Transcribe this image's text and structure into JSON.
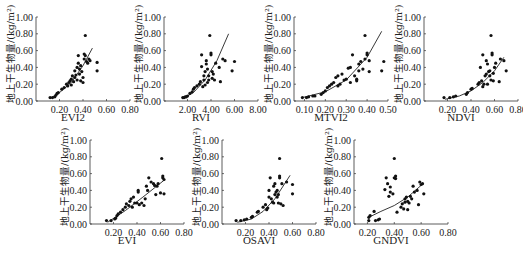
{
  "chart_data": [
    {
      "type": "scatter",
      "title": "EVI2",
      "xlabel": "EVI2",
      "ylabel": "地上干生物量/(kg/m²)",
      "xlim": [
        0,
        0.8
      ],
      "ylim": [
        0,
        1.0
      ],
      "xticks": [
        "0.20",
        "0.40",
        "0.60",
        "0.80"
      ],
      "yticks": [
        "0.00",
        "0.20",
        "0.40",
        "0.60",
        "0.80",
        "1.00"
      ],
      "fit": {
        "x": [
          0.12,
          0.2,
          0.3,
          0.4,
          0.48
        ],
        "y": [
          0.03,
          0.1,
          0.22,
          0.42,
          0.63
        ]
      },
      "points": [
        [
          0.12,
          0.04
        ],
        [
          0.14,
          0.04
        ],
        [
          0.16,
          0.05
        ],
        [
          0.17,
          0.07
        ],
        [
          0.18,
          0.09
        ],
        [
          0.19,
          0.1
        ],
        [
          0.22,
          0.14
        ],
        [
          0.24,
          0.16
        ],
        [
          0.26,
          0.2
        ],
        [
          0.27,
          0.18
        ],
        [
          0.28,
          0.22
        ],
        [
          0.29,
          0.24
        ],
        [
          0.3,
          0.19
        ],
        [
          0.3,
          0.26
        ],
        [
          0.31,
          0.3
        ],
        [
          0.32,
          0.23
        ],
        [
          0.33,
          0.28
        ],
        [
          0.33,
          0.36
        ],
        [
          0.34,
          0.31
        ],
        [
          0.35,
          0.4
        ],
        [
          0.35,
          0.25
        ],
        [
          0.36,
          0.45
        ],
        [
          0.36,
          0.54
        ],
        [
          0.37,
          0.38
        ],
        [
          0.37,
          0.32
        ],
        [
          0.38,
          0.24
        ],
        [
          0.38,
          0.42
        ],
        [
          0.39,
          0.35
        ],
        [
          0.4,
          0.22
        ],
        [
          0.4,
          0.28
        ],
        [
          0.41,
          0.5
        ],
        [
          0.41,
          0.56
        ],
        [
          0.42,
          0.54
        ],
        [
          0.42,
          0.78
        ],
        [
          0.43,
          0.47
        ],
        [
          0.44,
          0.45
        ],
        [
          0.45,
          0.5
        ],
        [
          0.46,
          0.48
        ],
        [
          0.52,
          0.46
        ],
        [
          0.52,
          0.36
        ]
      ]
    },
    {
      "type": "scatter",
      "title": "RVI",
      "xlabel": "RVI",
      "ylabel": "地上干生物量/(kg/m²)",
      "xlim": [
        0,
        8.0
      ],
      "ylim": [
        0,
        1.0
      ],
      "xticks": [
        "2.00",
        "4.00",
        "6.00",
        "8.00"
      ],
      "yticks": [
        "0.00",
        "0.20",
        "0.40",
        "0.60",
        "0.80",
        "1.00"
      ],
      "fit": {
        "x": [
          1.6,
          2.5,
          3.5,
          4.5,
          5.5
        ],
        "y": [
          0.03,
          0.1,
          0.25,
          0.48,
          0.8
        ]
      },
      "points": [
        [
          1.6,
          0.04
        ],
        [
          1.7,
          0.04
        ],
        [
          1.8,
          0.05
        ],
        [
          1.9,
          0.05
        ],
        [
          2.0,
          0.06
        ],
        [
          2.2,
          0.09
        ],
        [
          2.4,
          0.11
        ],
        [
          2.5,
          0.14
        ],
        [
          2.6,
          0.16
        ],
        [
          2.8,
          0.18
        ],
        [
          3.0,
          0.2
        ],
        [
          3.1,
          0.23
        ],
        [
          3.2,
          0.41
        ],
        [
          3.2,
          0.55
        ],
        [
          3.3,
          0.17
        ],
        [
          3.4,
          0.25
        ],
        [
          3.4,
          0.3
        ],
        [
          3.5,
          0.35
        ],
        [
          3.5,
          0.19
        ],
        [
          3.6,
          0.48
        ],
        [
          3.6,
          0.44
        ],
        [
          3.7,
          0.22
        ],
        [
          3.7,
          0.38
        ],
        [
          3.8,
          0.3
        ],
        [
          3.8,
          0.25
        ],
        [
          3.9,
          0.78
        ],
        [
          4.0,
          0.55
        ],
        [
          4.0,
          0.57
        ],
        [
          4.1,
          0.35
        ],
        [
          4.1,
          0.27
        ],
        [
          4.2,
          0.32
        ],
        [
          4.3,
          0.25
        ],
        [
          4.4,
          0.45
        ],
        [
          4.7,
          0.4
        ],
        [
          4.8,
          0.23
        ],
        [
          5.0,
          0.5
        ],
        [
          5.2,
          0.48
        ],
        [
          5.8,
          0.36
        ],
        [
          6.0,
          0.47
        ]
      ]
    },
    {
      "type": "scatter",
      "title": "MTVI2",
      "xlabel": "MTVI2",
      "ylabel": "地上干生物量/(kg/m²)",
      "xlim": [
        0.05,
        0.5
      ],
      "ylim": [
        0,
        1.0
      ],
      "xticks": [
        "0.10",
        "0.20",
        "0.30",
        "0.40",
        "0.50"
      ],
      "yticks": [
        "0.00",
        "0.20",
        "0.40",
        "0.60",
        "0.80",
        "1.00"
      ],
      "fit": {
        "x": [
          0.09,
          0.2,
          0.3,
          0.4,
          0.47
        ],
        "y": [
          0.04,
          0.11,
          0.25,
          0.52,
          0.83
        ]
      },
      "points": [
        [
          0.09,
          0.04
        ],
        [
          0.11,
          0.04
        ],
        [
          0.12,
          0.05
        ],
        [
          0.14,
          0.06
        ],
        [
          0.15,
          0.06
        ],
        [
          0.18,
          0.08
        ],
        [
          0.19,
          0.1
        ],
        [
          0.2,
          0.12
        ],
        [
          0.21,
          0.16
        ],
        [
          0.22,
          0.18
        ],
        [
          0.23,
          0.2
        ],
        [
          0.24,
          0.22
        ],
        [
          0.25,
          0.28
        ],
        [
          0.26,
          0.3
        ],
        [
          0.26,
          0.18
        ],
        [
          0.27,
          0.2
        ],
        [
          0.28,
          0.32
        ],
        [
          0.29,
          0.25
        ],
        [
          0.3,
          0.26
        ],
        [
          0.31,
          0.39
        ],
        [
          0.32,
          0.4
        ],
        [
          0.32,
          0.22
        ],
        [
          0.33,
          0.55
        ],
        [
          0.34,
          0.3
        ],
        [
          0.35,
          0.26
        ],
        [
          0.35,
          0.24
        ],
        [
          0.36,
          0.36
        ],
        [
          0.36,
          0.44
        ],
        [
          0.37,
          0.47
        ],
        [
          0.38,
          0.38
        ],
        [
          0.39,
          0.5
        ],
        [
          0.39,
          0.78
        ],
        [
          0.4,
          0.55
        ],
        [
          0.4,
          0.57
        ],
        [
          0.41,
          0.48
        ],
        [
          0.41,
          0.35
        ],
        [
          0.47,
          0.36
        ],
        [
          0.48,
          0.47
        ]
      ]
    },
    {
      "type": "scatter",
      "title": "NDVI",
      "xlabel": "NDVI",
      "ylabel": "地上干生物量/(kg/m²)",
      "xlim": [
        0,
        0.8
      ],
      "ylim": [
        0,
        1.0
      ],
      "xticks": [
        "0.20",
        "0.40",
        "0.60",
        "0.80"
      ],
      "yticks": [
        "0.00",
        "0.20",
        "0.40",
        "0.60",
        "0.80",
        "1.00"
      ],
      "fit": {
        "x": [
          0.18,
          0.3,
          0.4,
          0.5,
          0.6,
          0.68
        ],
        "y": [
          0.02,
          0.06,
          0.12,
          0.22,
          0.36,
          0.52
        ]
      },
      "points": [
        [
          0.17,
          0.04
        ],
        [
          0.22,
          0.04
        ],
        [
          0.25,
          0.05
        ],
        [
          0.27,
          0.06
        ],
        [
          0.36,
          0.08
        ],
        [
          0.37,
          0.1
        ],
        [
          0.4,
          0.14
        ],
        [
          0.41,
          0.15
        ],
        [
          0.46,
          0.2
        ],
        [
          0.47,
          0.22
        ],
        [
          0.48,
          0.4
        ],
        [
          0.49,
          0.24
        ],
        [
          0.5,
          0.55
        ],
        [
          0.5,
          0.17
        ],
        [
          0.51,
          0.2
        ],
        [
          0.52,
          0.3
        ],
        [
          0.53,
          0.32
        ],
        [
          0.53,
          0.48
        ],
        [
          0.54,
          0.44
        ],
        [
          0.54,
          0.2
        ],
        [
          0.55,
          0.35
        ],
        [
          0.56,
          0.3
        ],
        [
          0.56,
          0.36
        ],
        [
          0.57,
          0.25
        ],
        [
          0.57,
          0.78
        ],
        [
          0.58,
          0.55
        ],
        [
          0.58,
          0.57
        ],
        [
          0.59,
          0.33
        ],
        [
          0.59,
          0.24
        ],
        [
          0.6,
          0.4
        ],
        [
          0.61,
          0.45
        ],
        [
          0.64,
          0.23
        ],
        [
          0.65,
          0.5
        ],
        [
          0.68,
          0.48
        ],
        [
          0.7,
          0.36
        ]
      ]
    },
    {
      "type": "scatter",
      "title": "EVI",
      "xlabel": "EVI",
      "ylabel": "地上干生物量/(kg/m²)",
      "xlim": [
        0,
        0.8
      ],
      "ylim": [
        0,
        1.0
      ],
      "xticks": [
        "0.20",
        "0.40",
        "0.60",
        "0.80"
      ],
      "yticks": [
        "0.00",
        "0.20",
        "0.40",
        "0.60",
        "0.80",
        "1.00"
      ],
      "fit": {
        "x": [
          0.15,
          0.3,
          0.45,
          0.63
        ],
        "y": [
          0.02,
          0.16,
          0.32,
          0.52
        ]
      },
      "points": [
        [
          0.14,
          0.04
        ],
        [
          0.18,
          0.04
        ],
        [
          0.21,
          0.06
        ],
        [
          0.22,
          0.07
        ],
        [
          0.23,
          0.1
        ],
        [
          0.24,
          0.12
        ],
        [
          0.26,
          0.14
        ],
        [
          0.28,
          0.17
        ],
        [
          0.3,
          0.2
        ],
        [
          0.31,
          0.24
        ],
        [
          0.33,
          0.22
        ],
        [
          0.34,
          0.27
        ],
        [
          0.35,
          0.3
        ],
        [
          0.36,
          0.2
        ],
        [
          0.37,
          0.32
        ],
        [
          0.38,
          0.25
        ],
        [
          0.4,
          0.25
        ],
        [
          0.41,
          0.38
        ],
        [
          0.41,
          0.4
        ],
        [
          0.42,
          0.23
        ],
        [
          0.44,
          0.25
        ],
        [
          0.46,
          0.22
        ],
        [
          0.47,
          0.3
        ],
        [
          0.48,
          0.45
        ],
        [
          0.49,
          0.4
        ],
        [
          0.5,
          0.55
        ],
        [
          0.52,
          0.5
        ],
        [
          0.54,
          0.48
        ],
        [
          0.55,
          0.46
        ],
        [
          0.56,
          0.35
        ],
        [
          0.57,
          0.45
        ],
        [
          0.58,
          0.48
        ],
        [
          0.6,
          0.37
        ],
        [
          0.61,
          0.78
        ],
        [
          0.62,
          0.55
        ],
        [
          0.62,
          0.57
        ],
        [
          0.63,
          0.36
        ],
        [
          0.63,
          0.53
        ]
      ]
    },
    {
      "type": "scatter",
      "title": "OSAVI",
      "xlabel": "OSAVI",
      "ylabel": "地上干生物量/(kg/m²)",
      "xlim": [
        0,
        0.8
      ],
      "ylim": [
        0,
        1.0
      ],
      "xticks": [
        "0.20",
        "0.40",
        "0.60",
        "0.80"
      ],
      "yticks": [
        "0.00",
        "0.20",
        "0.40",
        "0.60",
        "0.80",
        "1.00"
      ],
      "fit": {
        "x": [
          0.13,
          0.25,
          0.35,
          0.45,
          0.58
        ],
        "y": [
          0.02,
          0.06,
          0.15,
          0.3,
          0.58
        ]
      },
      "points": [
        [
          0.12,
          0.04
        ],
        [
          0.16,
          0.04
        ],
        [
          0.19,
          0.05
        ],
        [
          0.21,
          0.06
        ],
        [
          0.25,
          0.08
        ],
        [
          0.26,
          0.09
        ],
        [
          0.3,
          0.14
        ],
        [
          0.31,
          0.15
        ],
        [
          0.35,
          0.2
        ],
        [
          0.37,
          0.23
        ],
        [
          0.38,
          0.17
        ],
        [
          0.39,
          0.19
        ],
        [
          0.4,
          0.32
        ],
        [
          0.4,
          0.4
        ],
        [
          0.41,
          0.55
        ],
        [
          0.42,
          0.3
        ],
        [
          0.43,
          0.26
        ],
        [
          0.44,
          0.45
        ],
        [
          0.44,
          0.25
        ],
        [
          0.45,
          0.35
        ],
        [
          0.45,
          0.48
        ],
        [
          0.46,
          0.38
        ],
        [
          0.47,
          0.32
        ],
        [
          0.47,
          0.4
        ],
        [
          0.48,
          0.25
        ],
        [
          0.48,
          0.35
        ],
        [
          0.49,
          0.78
        ],
        [
          0.49,
          0.55
        ],
        [
          0.49,
          0.57
        ],
        [
          0.5,
          0.24
        ],
        [
          0.51,
          0.48
        ],
        [
          0.52,
          0.22
        ],
        [
          0.55,
          0.5
        ],
        [
          0.6,
          0.47
        ],
        [
          0.6,
          0.36
        ]
      ]
    },
    {
      "type": "scatter",
      "title": "GNDVI",
      "xlabel": "GNDVI",
      "ylabel": "地上干生物量/(kg/m²)",
      "xlim": [
        0.1,
        0.8
      ],
      "ylim": [
        0,
        1.0
      ],
      "xticks": [
        "0.20",
        "0.40",
        "0.60",
        "0.80"
      ],
      "yticks": [
        "0.00",
        "0.20",
        "0.40",
        "0.60",
        "0.80",
        "1.00"
      ],
      "fit": {
        "x": [
          0.21,
          0.3,
          0.4,
          0.5,
          0.6
        ],
        "y": [
          0.08,
          0.15,
          0.22,
          0.32,
          0.46
        ]
      },
      "points": [
        [
          0.21,
          0.04
        ],
        [
          0.21,
          0.08
        ],
        [
          0.22,
          0.1
        ],
        [
          0.25,
          0.15
        ],
        [
          0.26,
          0.04
        ],
        [
          0.28,
          0.05
        ],
        [
          0.29,
          0.06
        ],
        [
          0.33,
          0.41
        ],
        [
          0.34,
          0.55
        ],
        [
          0.35,
          0.48
        ],
        [
          0.36,
          0.33
        ],
        [
          0.37,
          0.44
        ],
        [
          0.37,
          0.38
        ],
        [
          0.39,
          0.36
        ],
        [
          0.4,
          0.78
        ],
        [
          0.4,
          0.55
        ],
        [
          0.41,
          0.57
        ],
        [
          0.41,
          0.54
        ],
        [
          0.42,
          0.14
        ],
        [
          0.45,
          0.2
        ],
        [
          0.46,
          0.24
        ],
        [
          0.47,
          0.18
        ],
        [
          0.48,
          0.3
        ],
        [
          0.48,
          0.26
        ],
        [
          0.49,
          0.32
        ],
        [
          0.5,
          0.17
        ],
        [
          0.5,
          0.27
        ],
        [
          0.51,
          0.25
        ],
        [
          0.52,
          0.33
        ],
        [
          0.53,
          0.3
        ],
        [
          0.54,
          0.45
        ],
        [
          0.55,
          0.38
        ],
        [
          0.57,
          0.4
        ],
        [
          0.58,
          0.23
        ],
        [
          0.59,
          0.5
        ],
        [
          0.6,
          0.47
        ],
        [
          0.61,
          0.48
        ],
        [
          0.62,
          0.36
        ]
      ]
    }
  ],
  "layout": {
    "panels": [
      {
        "left": 0,
        "top": 0
      },
      {
        "left": 128,
        "top": 0
      },
      {
        "left": 258,
        "top": 0
      },
      {
        "left": 388,
        "top": 0
      },
      {
        "left": 54,
        "top": 123
      },
      {
        "left": 186,
        "top": 123
      },
      {
        "left": 318,
        "top": 123
      }
    ]
  }
}
